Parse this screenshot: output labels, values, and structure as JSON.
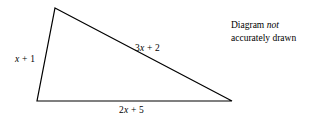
{
  "figure": {
    "type": "geometry-triangle-diagram",
    "background_color": "#ffffff",
    "stroke_color": "#000000",
    "stroke_width": 1.2,
    "vertices": {
      "apex": [
        55,
        8
      ],
      "bottom_left": [
        37,
        101
      ],
      "bottom_right": [
        232,
        101
      ]
    },
    "labels": {
      "left_side": {
        "full": "x + 1",
        "variable": "x",
        "rest": " + 1"
      },
      "hypotenuse": {
        "full": "3x + 2",
        "coefficient": "3",
        "variable": "x",
        "rest": " + 2"
      },
      "base": {
        "full": "2x + 5",
        "coefficient": "2",
        "variable": "x",
        "rest": " + 5"
      }
    },
    "note": {
      "line1_prefix": "Diagram ",
      "line1_emphasis": "not",
      "line2": "accurately drawn"
    }
  }
}
